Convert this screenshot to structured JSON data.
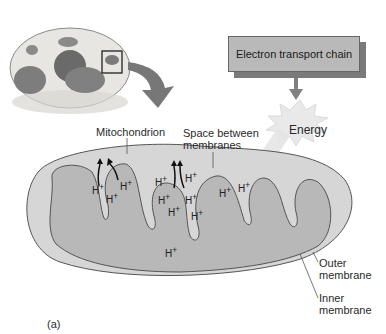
{
  "figure": {
    "panel_label": "(a)",
    "cell_illustration": "animal-cell-with-mitochondrion-highlighted",
    "box_label": "Electron transport chain",
    "energy_label": "Energy",
    "labels": {
      "mitochondrion": "Mitochondrion",
      "space_between_line1": "Space between",
      "space_between_line2": "membranes",
      "outer_line1": "Outer",
      "outer_line2": "membrane",
      "inner_line1": "Inner",
      "inner_line2": "membrane"
    },
    "proton": "H",
    "proton_charge": "+",
    "colors": {
      "matrix": "#b8b8b8",
      "intermembrane": "#d6d6d6",
      "membrane_line": "#555555",
      "box": "#b9b9b9",
      "box_shadow": "#7a7a7a",
      "arrow": "#808080"
    }
  }
}
